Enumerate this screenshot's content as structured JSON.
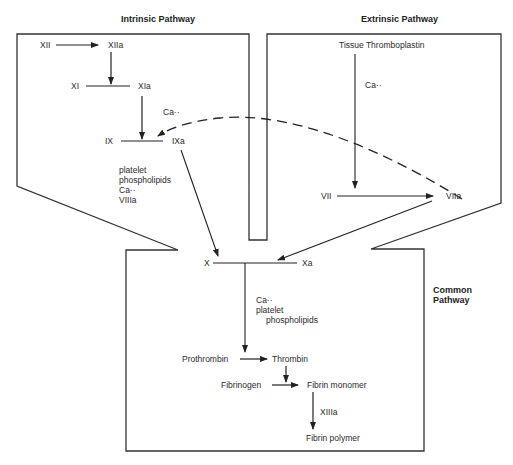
{
  "titles": {
    "intrinsic": "Intrinsic Pathway",
    "extrinsic": "Extrinsic Pathway",
    "common_1": "Common",
    "common_2": "Pathway"
  },
  "intrinsic": {
    "xii": "XII",
    "xiia": "XIIa",
    "xi": "XI",
    "xia": "XIa",
    "ca": "Ca··",
    "ix": "IX",
    "ixa": "IXa",
    "cofactors": [
      "platelet",
      "phospholipids",
      "Ca··",
      "VIIIa"
    ]
  },
  "extrinsic": {
    "tissue_thromboplastin": "Tissue Thromboplastin",
    "ca": "Ca··",
    "vii": "VII",
    "viia": "VIIa"
  },
  "common": {
    "x": "X",
    "xa": "Xa",
    "cofactors": [
      "Ca··",
      "platelet",
      "phospholipids"
    ],
    "prothrombin": "Prothrombin",
    "thrombin": "Thrombin",
    "fibrinogen": "Fibrinogen",
    "fibrin_monomer": "Fibrin monomer",
    "xiiia": "XIIIa",
    "fibrin_polymer": "Fibrin polymer"
  }
}
